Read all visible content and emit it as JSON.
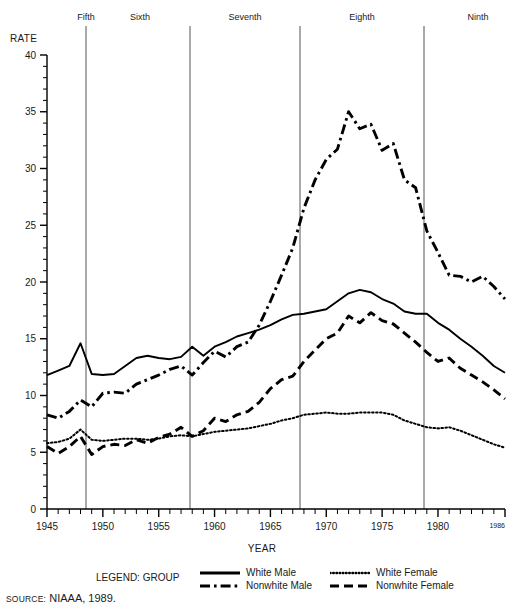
{
  "labels": {
    "rate_axis_title": "RATE",
    "year_axis_title": "YEAR",
    "legend_title": "LEGEND: GROUP",
    "source_prefix": "SOURCE:",
    "source_text": "NIAAA, 1989."
  },
  "periods": [
    {
      "name": "Fifth",
      "label_x": 86,
      "line_x": 86,
      "year": 1948.5
    },
    {
      "name": "Sixth",
      "label_x": 140,
      "line_x": 190,
      "year": 1957.5
    },
    {
      "name": "Seventh",
      "label_x": 245,
      "line_x": 300,
      "year": 1967.5
    },
    {
      "name": "Eighth",
      "label_x": 362,
      "line_x": 424,
      "year": 1978.5
    },
    {
      "name": "Ninth",
      "label_x": 478,
      "line_x": null,
      "year": null
    }
  ],
  "chart_data": {
    "type": "line",
    "title": "",
    "xlabel": "YEAR",
    "ylabel": "RATE",
    "xlim": [
      1945,
      1986
    ],
    "ylim": [
      0,
      40
    ],
    "yticks": [
      0,
      5,
      10,
      15,
      20,
      25,
      30,
      35,
      40
    ],
    "ytick_labels": [
      "0",
      "5",
      "10",
      "15",
      "20",
      "25",
      "30",
      "35",
      "40"
    ],
    "yminor_step": 1,
    "xticks": [
      1945,
      1950,
      1955,
      1960,
      1965,
      1970,
      1975,
      1980,
      1986
    ],
    "xtick_labels": [
      "1945",
      "1950",
      "1955",
      "1960",
      "1965",
      "1970",
      "1975",
      "1980",
      "1986"
    ],
    "xminor_step": 1,
    "grid": false,
    "legend_position": "below",
    "x": [
      1945,
      1946,
      1947,
      1948,
      1949,
      1950,
      1951,
      1952,
      1953,
      1954,
      1955,
      1956,
      1957,
      1958,
      1959,
      1960,
      1961,
      1962,
      1963,
      1964,
      1965,
      1966,
      1967,
      1968,
      1969,
      1970,
      1971,
      1972,
      1973,
      1974,
      1975,
      1976,
      1977,
      1978,
      1979,
      1980,
      1981,
      1982,
      1983,
      1984,
      1985,
      1986
    ],
    "series": [
      {
        "name": "White Male",
        "style": "solid",
        "color": "#000000",
        "values": [
          11.8,
          12.2,
          12.6,
          14.6,
          11.9,
          11.8,
          11.9,
          12.6,
          13.3,
          13.5,
          13.3,
          13.2,
          13.4,
          14.3,
          13.5,
          14.3,
          14.7,
          15.2,
          15.5,
          15.8,
          16.2,
          16.7,
          17.1,
          17.2,
          17.4,
          17.6,
          18.3,
          19.0,
          19.3,
          19.1,
          18.5,
          18.1,
          17.4,
          17.2,
          17.2,
          16.4,
          15.8,
          15.0,
          14.3,
          13.5,
          12.6,
          12.0
        ]
      },
      {
        "name": "Nonwhite Male",
        "style": "dashdot",
        "color": "#000000",
        "values": [
          8.3,
          8.0,
          8.6,
          9.6,
          9.0,
          10.2,
          10.3,
          10.2,
          11.0,
          11.4,
          11.8,
          12.3,
          12.6,
          11.8,
          12.9,
          13.9,
          13.4,
          14.3,
          14.7,
          16.2,
          18.3,
          20.6,
          23.0,
          26.5,
          29.0,
          30.8,
          31.7,
          35.0,
          33.5,
          33.9,
          31.6,
          32.2,
          29.0,
          28.3,
          24.5,
          22.6,
          20.6,
          20.5,
          20.0,
          20.5,
          19.6,
          18.5
        ]
      },
      {
        "name": "White Female",
        "style": "dotted",
        "color": "#000000",
        "values": [
          5.8,
          5.9,
          6.2,
          7.0,
          6.1,
          6.0,
          6.1,
          6.2,
          6.2,
          6.1,
          6.2,
          6.4,
          6.5,
          6.4,
          6.6,
          6.8,
          6.9,
          7.0,
          7.1,
          7.3,
          7.5,
          7.8,
          8.0,
          8.3,
          8.4,
          8.5,
          8.4,
          8.4,
          8.5,
          8.5,
          8.5,
          8.3,
          7.8,
          7.5,
          7.2,
          7.1,
          7.2,
          6.9,
          6.5,
          6.1,
          5.7,
          5.4
        ]
      },
      {
        "name": "Nonwhite Female",
        "style": "dashed",
        "color": "#000000",
        "values": [
          5.5,
          4.9,
          5.5,
          6.4,
          4.8,
          5.5,
          5.7,
          5.6,
          6.1,
          5.8,
          6.3,
          6.6,
          7.2,
          6.4,
          6.9,
          8.0,
          7.7,
          8.3,
          8.6,
          9.4,
          10.6,
          11.4,
          11.7,
          13.0,
          14.0,
          15.0,
          15.5,
          17.0,
          16.4,
          17.3,
          16.6,
          16.3,
          15.5,
          14.7,
          13.8,
          13.0,
          13.3,
          12.4,
          11.8,
          11.2,
          10.5,
          9.7
        ]
      }
    ]
  }
}
